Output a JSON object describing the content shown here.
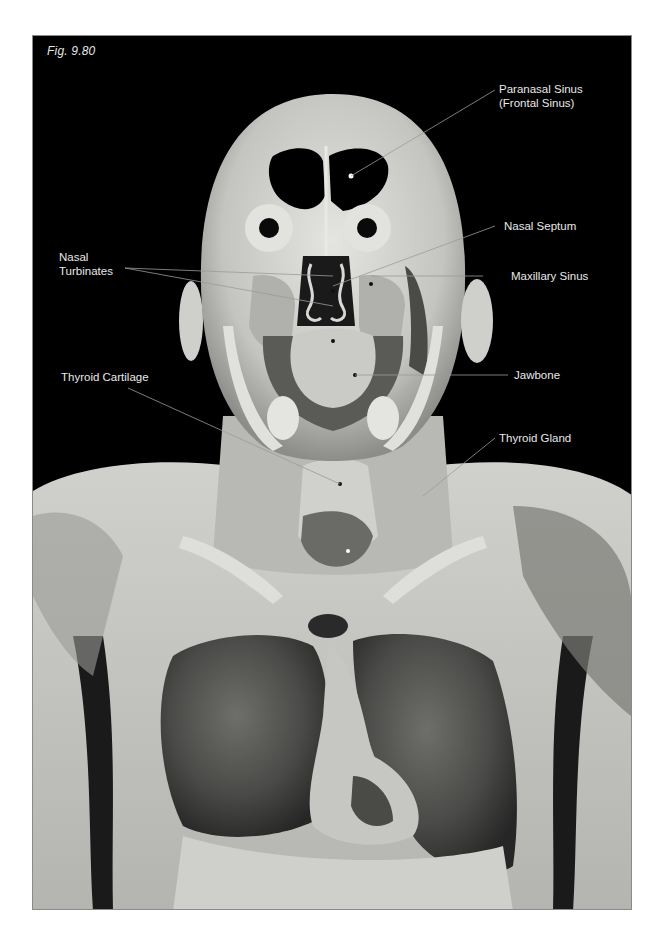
{
  "figure": {
    "caption": "Fig. 9.80",
    "background_color": "#000000",
    "border_color": "#8a8a8a"
  },
  "labels": {
    "paranasal_sinus": "Paranasal Sinus\n(Frontal Sinus)",
    "nasal_septum": "Nasal Septum",
    "maxillary_sinus": "Maxillary Sinus",
    "nasal_turbinates": "Nasal\nTurbinates",
    "jawbone": "Jawbone",
    "thyroid_cartilage": "Thyroid Cartilage",
    "thyroid_gland": "Thyroid Gland"
  },
  "colors": {
    "label_text": "#e8e8e8",
    "leader_line": "#9a9a9a",
    "tissue_light": "#d8d8d4",
    "tissue_mid": "#a8a8a4",
    "tissue_dark": "#3a3a3a"
  }
}
